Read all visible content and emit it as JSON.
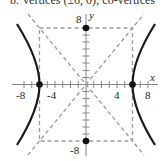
{
  "caption": "b. Vertices (±6, 0); co-vertices",
  "graph": {
    "type": "hyperbola",
    "equation_hint": "x^2/36 - y^2/64 = 1",
    "vertices": [
      [
        -6,
        0
      ],
      [
        6,
        0
      ]
    ],
    "co_vertices": [
      [
        0,
        8
      ],
      [
        0,
        -8
      ]
    ],
    "asymptotes": [
      "y = 4/3 x",
      "y = -4/3 x"
    ],
    "x_axis_label": "x",
    "y_axis_label": "y",
    "x_tick_labels": [
      "-8",
      "-4",
      "4",
      "8"
    ],
    "y_tick_labels": [
      "8",
      "-8"
    ],
    "curve_color": "#1a1a1a",
    "dashed_color": "#9a9a9a"
  }
}
